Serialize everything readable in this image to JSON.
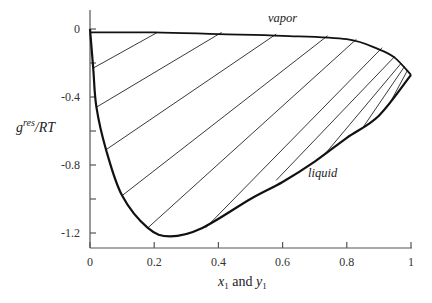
{
  "chart_data": {
    "type": "line",
    "title": "",
    "xlabel": "x1 and y1",
    "ylabel": "g^res/RT",
    "xlim": [
      0,
      1
    ],
    "ylim": [
      -1.3,
      0.1
    ],
    "xticks": [
      0,
      0.2,
      0.4,
      0.6,
      0.8,
      1
    ],
    "xtick_labels": [
      "0",
      "0.2",
      "0.4",
      "0.6",
      "0.8",
      "1"
    ],
    "yticks": [
      0,
      -0.2,
      -0.4,
      -0.6,
      -0.8,
      -1.0,
      -1.2
    ],
    "ytick_labels": [
      "0",
      "",
      "-0.4",
      "",
      "-0.8",
      "",
      "-1.2"
    ],
    "grid": false,
    "legend": null,
    "annotations": [
      {
        "text": "vapor",
        "x": 0.56,
        "y": 0.03
      },
      {
        "text": "liquid",
        "x": 0.68,
        "y": -0.86
      }
    ],
    "series": [
      {
        "name": "liquid",
        "x": [
          0,
          0.01,
          0.02,
          0.05,
          0.1,
          0.18,
          0.25,
          0.35,
          0.5,
          0.6,
          0.7,
          0.8,
          0.9,
          1.0
        ],
        "y": [
          0,
          -0.23,
          -0.46,
          -0.71,
          -0.98,
          -1.17,
          -1.22,
          -1.17,
          -1.0,
          -0.9,
          -0.78,
          -0.64,
          -0.51,
          -0.27
        ]
      },
      {
        "name": "vapor",
        "x": [
          0,
          0.2,
          0.4,
          0.6,
          0.8,
          0.9,
          0.95,
          1.0
        ],
        "y": [
          -0.02,
          -0.02,
          -0.03,
          -0.04,
          -0.06,
          -0.12,
          -0.17,
          -0.27
        ]
      }
    ],
    "tie_lines": [
      [
        [
          0.01,
          -0.23
        ],
        [
          0.21,
          -0.02
        ]
      ],
      [
        [
          0.02,
          -0.46
        ],
        [
          0.41,
          -0.02
        ]
      ],
      [
        [
          0.05,
          -0.71
        ],
        [
          0.58,
          -0.03
        ]
      ],
      [
        [
          0.1,
          -0.98
        ],
        [
          0.74,
          -0.04
        ]
      ],
      [
        [
          0.18,
          -1.17
        ],
        [
          0.83,
          -0.06
        ]
      ],
      [
        [
          0.36,
          -1.17
        ],
        [
          0.91,
          -0.11
        ]
      ],
      [
        [
          0.58,
          -0.89
        ],
        [
          0.95,
          -0.16
        ]
      ],
      [
        [
          0.73,
          -0.74
        ],
        [
          0.97,
          -0.2
        ]
      ],
      [
        [
          0.85,
          -0.58
        ],
        [
          0.98,
          -0.22
        ]
      ],
      [
        [
          0.93,
          -0.45
        ],
        [
          0.99,
          -0.24
        ]
      ]
    ]
  },
  "labels": {
    "ylabel_main": "g",
    "ylabel_sup": "res",
    "ylabel_tail": "/RT",
    "xlabel_x": "x",
    "xlabel_x_sub": "1",
    "xlabel_and": " and ",
    "xlabel_y": "y",
    "xlabel_y_sub": "1",
    "vapor": "vapor",
    "liquid": "liquid"
  }
}
